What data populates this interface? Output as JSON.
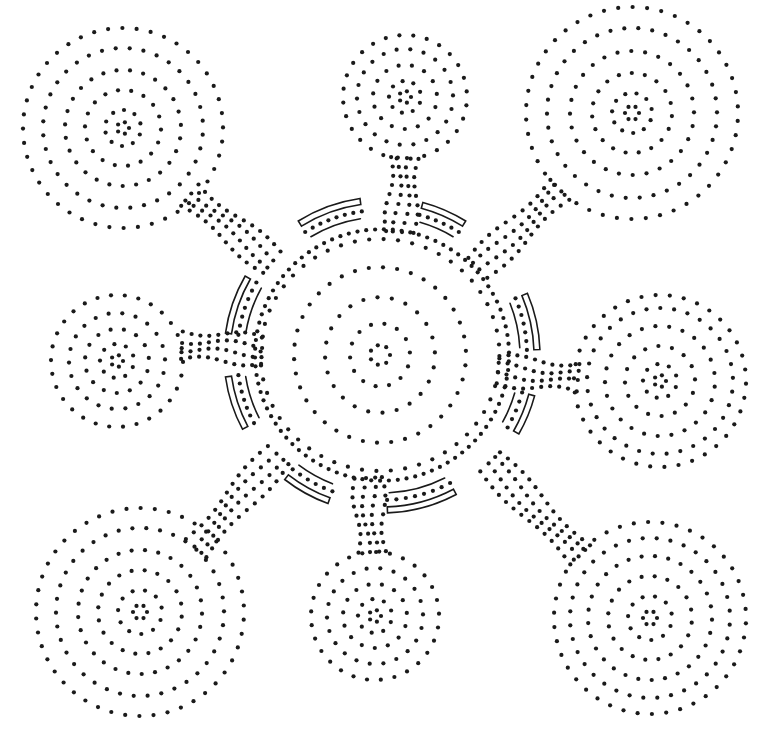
{
  "artwork": {
    "title": "Dot painting: central meeting place with eight connected waterholes",
    "background": "#ffffff",
    "ink": "#1a1a1a",
    "dot_radius": 2.1
  },
  "central": {
    "name": "central-circle",
    "cx": 380,
    "cy": 355,
    "rings": [
      {
        "r": 10,
        "n": 7,
        "sx": 1.0,
        "sy": 1.0
      },
      {
        "r": 30,
        "n": 14,
        "sx": 1.0,
        "sy": 1.05
      },
      {
        "r": 55,
        "n": 24,
        "sx": 1.0,
        "sy": 1.05
      },
      {
        "r": 86,
        "n": 38,
        "sx": 1.0,
        "sy": 1.02
      },
      {
        "r": 116,
        "n": 52,
        "sx": 1.03,
        "sy": 1.0
      }
    ]
  },
  "satellites": [
    {
      "name": "top-left-circle",
      "cx": 123,
      "cy": 128,
      "rings": [
        {
          "r": 6,
          "n": 5
        },
        {
          "r": 18,
          "n": 10
        },
        {
          "r": 38,
          "n": 18
        },
        {
          "r": 58,
          "n": 27
        },
        {
          "r": 80,
          "n": 36
        },
        {
          "r": 100,
          "n": 44
        }
      ]
    },
    {
      "name": "top-circle",
      "cx": 405,
      "cy": 97,
      "rings": [
        {
          "r": 6,
          "n": 5
        },
        {
          "r": 16,
          "n": 9
        },
        {
          "r": 32,
          "n": 15
        },
        {
          "r": 48,
          "n": 22
        },
        {
          "r": 62,
          "n": 28
        }
      ]
    },
    {
      "name": "top-right-circle",
      "cx": 632,
      "cy": 113,
      "rings": [
        {
          "r": 7,
          "n": 6
        },
        {
          "r": 20,
          "n": 11
        },
        {
          "r": 40,
          "n": 19
        },
        {
          "r": 62,
          "n": 28
        },
        {
          "r": 85,
          "n": 38
        },
        {
          "r": 106,
          "n": 46
        }
      ]
    },
    {
      "name": "left-circle",
      "cx": 117,
      "cy": 361,
      "rings": [
        {
          "r": 6,
          "n": 5
        },
        {
          "r": 17,
          "n": 9
        },
        {
          "r": 32,
          "n": 15
        },
        {
          "r": 48,
          "n": 22
        },
        {
          "r": 66,
          "n": 30
        }
      ]
    },
    {
      "name": "right-circle",
      "cx": 660,
      "cy": 381,
      "rings": [
        {
          "r": 6,
          "n": 5
        },
        {
          "r": 17,
          "n": 9
        },
        {
          "r": 35,
          "n": 16
        },
        {
          "r": 55,
          "n": 25
        },
        {
          "r": 73,
          "n": 33
        },
        {
          "r": 86,
          "n": 38
        }
      ]
    },
    {
      "name": "bottom-left-circle",
      "cx": 140,
      "cy": 612,
      "rings": [
        {
          "r": 7,
          "n": 6
        },
        {
          "r": 22,
          "n": 11
        },
        {
          "r": 42,
          "n": 20
        },
        {
          "r": 62,
          "n": 29
        },
        {
          "r": 84,
          "n": 38
        },
        {
          "r": 104,
          "n": 46
        }
      ]
    },
    {
      "name": "bottom-circle",
      "cx": 375,
      "cy": 616,
      "rings": [
        {
          "r": 6,
          "n": 5
        },
        {
          "r": 17,
          "n": 9
        },
        {
          "r": 32,
          "n": 15
        },
        {
          "r": 48,
          "n": 22
        },
        {
          "r": 64,
          "n": 29
        }
      ]
    },
    {
      "name": "bottom-right-circle",
      "cx": 650,
      "cy": 618,
      "rings": [
        {
          "r": 7,
          "n": 6
        },
        {
          "r": 22,
          "n": 11
        },
        {
          "r": 42,
          "n": 20
        },
        {
          "r": 62,
          "n": 29
        },
        {
          "r": 80,
          "n": 36
        },
        {
          "r": 96,
          "n": 42
        }
      ]
    }
  ],
  "connectors": [
    {
      "name": "connector-top-left",
      "from": [
        190,
        195
      ],
      "to": [
        272,
        262
      ],
      "lanes": 4,
      "spacing": 9,
      "step": 10
    },
    {
      "name": "connector-top",
      "from": [
        405,
        158
      ],
      "to": [
        400,
        232
      ],
      "lanes": 4,
      "spacing": 9,
      "step": 9
    },
    {
      "name": "connector-top-right",
      "from": [
        560,
        190
      ],
      "to": [
        478,
        268
      ],
      "lanes": 4,
      "spacing": 9,
      "step": 10
    },
    {
      "name": "connector-left",
      "from": [
        182,
        345
      ],
      "to": [
        262,
        350
      ],
      "lanes": 4,
      "spacing": 9,
      "step": 9
    },
    {
      "name": "connector-right",
      "from": [
        578,
        378
      ],
      "to": [
        498,
        370
      ],
      "lanes": 4,
      "spacing": 9,
      "step": 9
    },
    {
      "name": "connector-bottom-left",
      "from": [
        196,
        548
      ],
      "to": [
        278,
        455
      ],
      "lanes": 4,
      "spacing": 9,
      "step": 10
    },
    {
      "name": "connector-bottom",
      "from": [
        372,
        552
      ],
      "to": [
        368,
        478
      ],
      "lanes": 4,
      "spacing": 9,
      "step": 9
    },
    {
      "name": "connector-bottom-right",
      "from": [
        580,
        555
      ],
      "to": [
        490,
        462
      ],
      "lanes": 4,
      "spacing": 9,
      "step": 10
    }
  ],
  "arc_segments": [
    {
      "name": "arc-top-left",
      "start": 238,
      "end": 262
    },
    {
      "name": "arc-top-right",
      "start": 285,
      "end": 302
    },
    {
      "name": "arc-right-upper",
      "start": 337,
      "end": 358
    },
    {
      "name": "arc-right-lower",
      "start": 15,
      "end": 30
    },
    {
      "name": "arc-bottom-right",
      "start": 62,
      "end": 88
    },
    {
      "name": "arc-bottom-left",
      "start": 110,
      "end": 128
    },
    {
      "name": "arc-left-lower",
      "start": 152,
      "end": 172
    },
    {
      "name": "arc-left-upper",
      "start": 188,
      "end": 210
    }
  ],
  "arc_geometry": {
    "cx": 382,
    "cy": 355,
    "bar_inner_r": 152,
    "bar_outer_r": 158,
    "line_r": 138,
    "dots_r": 145
  }
}
